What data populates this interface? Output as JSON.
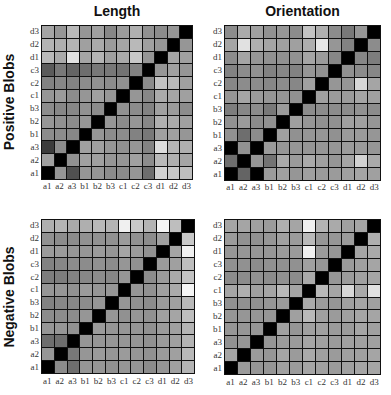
{
  "column_titles": [
    "Length",
    "Orientation"
  ],
  "row_titles": [
    "Positive Blobs",
    "Negative Blobs"
  ],
  "axis_labels": [
    "a1",
    "a2",
    "a3",
    "b1",
    "b2",
    "b3",
    "c1",
    "c2",
    "c3",
    "d1",
    "d2",
    "d3"
  ],
  "chart_data": {
    "type": "heatmap",
    "title": "",
    "layout": "2x2 grid of 12x12 similarity matrices",
    "colormap": "grayscale (0 = black, 255 = white)",
    "x_tick_labels": [
      "a1",
      "a2",
      "a3",
      "b1",
      "b2",
      "b3",
      "c1",
      "c2",
      "c3",
      "d1",
      "d2",
      "d3"
    ],
    "y_tick_labels_top_to_bottom": [
      "d3",
      "d2",
      "d1",
      "c3",
      "c2",
      "c1",
      "b3",
      "b2",
      "b1",
      "a3",
      "a2",
      "a1"
    ],
    "panels": [
      {
        "row": "Positive Blobs",
        "column": "Length",
        "gray_rows_top_to_bottom": [
          [
            165,
            150,
            185,
            150,
            160,
            135,
            155,
            175,
            145,
            140,
            150,
            0
          ],
          [
            180,
            175,
            180,
            160,
            170,
            155,
            165,
            185,
            160,
            150,
            0,
            150
          ],
          [
            185,
            170,
            225,
            165,
            180,
            160,
            170,
            200,
            150,
            0,
            165,
            160
          ],
          [
            90,
            120,
            100,
            110,
            120,
            120,
            115,
            130,
            0,
            150,
            160,
            150
          ],
          [
            130,
            135,
            130,
            140,
            145,
            140,
            145,
            0,
            140,
            195,
            185,
            160
          ],
          [
            150,
            155,
            140,
            150,
            160,
            150,
            0,
            150,
            135,
            170,
            165,
            160
          ],
          [
            140,
            135,
            135,
            145,
            140,
            0,
            145,
            140,
            130,
            160,
            155,
            140
          ],
          [
            150,
            145,
            140,
            150,
            0,
            150,
            140,
            150,
            135,
            175,
            170,
            160
          ],
          [
            140,
            140,
            135,
            0,
            150,
            140,
            140,
            130,
            120,
            160,
            160,
            150
          ],
          [
            60,
            140,
            0,
            160,
            160,
            150,
            145,
            150,
            130,
            220,
            180,
            175
          ],
          [
            160,
            0,
            145,
            160,
            160,
            150,
            150,
            160,
            140,
            185,
            175,
            165
          ],
          [
            0,
            150,
            80,
            150,
            150,
            140,
            140,
            150,
            110,
            210,
            200,
            190
          ]
        ]
      },
      {
        "row": "Positive Blobs",
        "column": "Orientation",
        "gray_rows_top_to_bottom": [
          [
            140,
            170,
            160,
            145,
            150,
            140,
            195,
            175,
            140,
            120,
            150,
            0
          ],
          [
            165,
            225,
            175,
            165,
            160,
            160,
            175,
            230,
            150,
            130,
            0,
            140
          ],
          [
            140,
            165,
            150,
            145,
            145,
            145,
            165,
            155,
            135,
            0,
            135,
            125
          ],
          [
            130,
            140,
            145,
            130,
            135,
            130,
            150,
            145,
            0,
            145,
            140,
            135
          ],
          [
            135,
            140,
            140,
            135,
            140,
            135,
            160,
            0,
            150,
            150,
            215,
            165
          ],
          [
            150,
            165,
            155,
            150,
            150,
            145,
            0,
            160,
            155,
            155,
            165,
            160
          ],
          [
            125,
            135,
            140,
            120,
            155,
            0,
            140,
            140,
            140,
            140,
            145,
            140
          ],
          [
            145,
            155,
            140,
            145,
            0,
            160,
            150,
            145,
            145,
            160,
            160,
            150
          ],
          [
            145,
            110,
            140,
            0,
            160,
            145,
            150,
            150,
            145,
            155,
            155,
            150
          ],
          [
            0,
            145,
            0,
            155,
            150,
            150,
            150,
            150,
            150,
            155,
            155,
            150
          ],
          [
            110,
            0,
            150,
            115,
            170,
            155,
            170,
            160,
            150,
            165,
            210,
            170
          ],
          [
            0,
            100,
            0,
            155,
            160,
            150,
            160,
            155,
            155,
            160,
            165,
            160
          ]
        ]
      },
      {
        "row": "Negative Blobs",
        "column": "Length",
        "gray_rows_top_to_bottom": [
          [
            175,
            180,
            170,
            175,
            185,
            180,
            240,
            200,
            180,
            245,
            190,
            0
          ],
          [
            145,
            140,
            140,
            145,
            145,
            145,
            155,
            145,
            140,
            160,
            0,
            200
          ],
          [
            155,
            155,
            150,
            150,
            155,
            150,
            165,
            155,
            145,
            0,
            165,
            240
          ],
          [
            130,
            135,
            140,
            140,
            145,
            140,
            150,
            145,
            0,
            155,
            160,
            190
          ],
          [
            125,
            125,
            130,
            135,
            140,
            135,
            150,
            0,
            140,
            155,
            170,
            195
          ],
          [
            150,
            150,
            145,
            155,
            150,
            150,
            0,
            150,
            145,
            160,
            170,
            245
          ],
          [
            130,
            135,
            135,
            140,
            150,
            0,
            150,
            145,
            140,
            155,
            160,
            185
          ],
          [
            140,
            140,
            140,
            150,
            0,
            150,
            145,
            150,
            145,
            160,
            165,
            190
          ],
          [
            150,
            150,
            145,
            0,
            155,
            150,
            150,
            150,
            145,
            155,
            160,
            180
          ],
          [
            110,
            110,
            0,
            150,
            150,
            150,
            150,
            150,
            145,
            155,
            160,
            180
          ],
          [
            150,
            0,
            120,
            150,
            155,
            150,
            155,
            150,
            145,
            155,
            160,
            185
          ],
          [
            0,
            140,
            110,
            150,
            150,
            145,
            150,
            150,
            140,
            150,
            160,
            180
          ]
        ]
      },
      {
        "row": "Negative Blobs",
        "column": "Orientation",
        "gray_rows_top_to_bottom": [
          [
            165,
            165,
            160,
            155,
            175,
            165,
            240,
            180,
            170,
            160,
            165,
            0
          ],
          [
            155,
            145,
            145,
            150,
            160,
            155,
            185,
            150,
            150,
            155,
            0,
            175
          ],
          [
            150,
            150,
            150,
            150,
            155,
            155,
            240,
            155,
            150,
            0,
            165,
            170
          ],
          [
            145,
            145,
            140,
            145,
            145,
            145,
            160,
            150,
            0,
            155,
            160,
            165
          ],
          [
            140,
            140,
            145,
            140,
            145,
            140,
            170,
            0,
            150,
            155,
            160,
            165
          ],
          [
            165,
            175,
            160,
            165,
            185,
            165,
            0,
            185,
            165,
            215,
            170,
            225
          ],
          [
            145,
            145,
            145,
            150,
            155,
            0,
            170,
            155,
            150,
            160,
            165,
            160
          ],
          [
            150,
            150,
            150,
            150,
            0,
            160,
            185,
            160,
            155,
            160,
            165,
            165
          ],
          [
            150,
            150,
            150,
            0,
            160,
            150,
            160,
            160,
            155,
            155,
            165,
            160
          ],
          [
            145,
            150,
            0,
            150,
            155,
            155,
            165,
            160,
            155,
            160,
            160,
            160
          ],
          [
            165,
            0,
            155,
            150,
            165,
            155,
            170,
            160,
            155,
            160,
            160,
            165
          ],
          [
            0,
            155,
            150,
            150,
            160,
            155,
            165,
            160,
            155,
            160,
            165,
            165
          ]
        ]
      }
    ]
  }
}
